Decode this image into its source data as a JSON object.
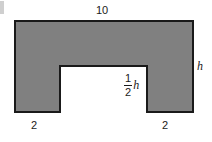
{
  "figure": {
    "type": "geometry-diagram",
    "fill_color": "#808080",
    "stroke_color": "#1a1a1a",
    "background_color": "#ffffff",
    "labels": {
      "top_width": "10",
      "right_height": "h",
      "notch_depth_numerator": "1",
      "notch_depth_denominator": "2",
      "notch_depth_variable": "h",
      "bottom_left_leg": "2",
      "bottom_right_leg": "2"
    },
    "geometry": {
      "outer_left": 15,
      "outer_top": 21,
      "outer_right": 193,
      "outer_bottom": 112,
      "notch_left": 60,
      "notch_right": 147,
      "notch_top": 66,
      "notch_bottom": 112
    }
  },
  "chart_data": {
    "type": "diagram",
    "title": "",
    "shape": "U-shaped polygon",
    "dimensions": [
      {
        "name": "total width",
        "value": "10",
        "position": "top"
      },
      {
        "name": "total height",
        "value": "h",
        "position": "right"
      },
      {
        "name": "notch height",
        "value": "1/2 h",
        "position": "interior-right-of-notch"
      },
      {
        "name": "left leg width",
        "value": "2",
        "position": "bottom-left"
      },
      {
        "name": "right leg width",
        "value": "2",
        "position": "bottom-right"
      }
    ]
  }
}
